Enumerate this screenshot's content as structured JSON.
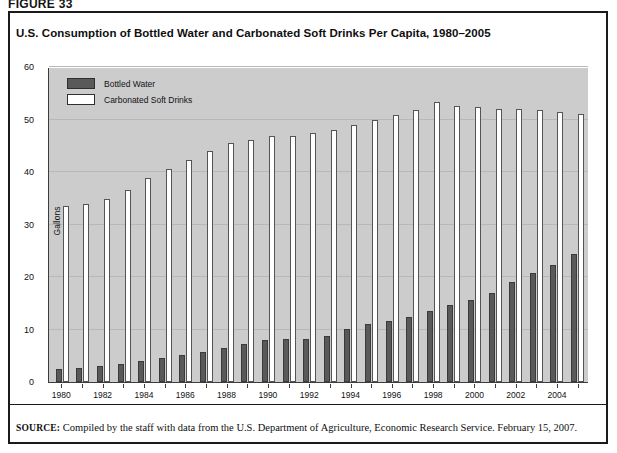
{
  "figure_label": "FIGURE 33",
  "title": "U.S. Consumption of Bottled Water and Carbonated Soft Drinks Per Capita, 1980–2005",
  "source": {
    "prefix": "SOURCE:",
    "text": " Compiled by the staff with data from the U.S. Department of Agriculture, Economic Research Service. February 15, 2007."
  },
  "legend": {
    "items": [
      {
        "label": "Bottled Water",
        "color": "#595959"
      },
      {
        "label": "Carbonated Soft Drinks",
        "color": "#ffffff"
      }
    ]
  },
  "colors": {
    "plot_background": "#cccccc",
    "bottled_water": "#595959",
    "carbonated_soft_drinks": "#ffffff",
    "axis": "#3d3d3d",
    "frame": "#1a1a1a"
  },
  "chart_data": {
    "type": "bar",
    "title": "U.S. Consumption of Bottled Water and Carbonated Soft Drinks Per Capita, 1980–2005",
    "xlabel": "",
    "ylabel": "Gallons",
    "ylim": [
      0,
      60
    ],
    "yticks": [
      0,
      10,
      20,
      30,
      40,
      50,
      60
    ],
    "grid": true,
    "legend_position": "top-left",
    "categories": [
      "1980",
      "1981",
      "1982",
      "1983",
      "1984",
      "1985",
      "1986",
      "1987",
      "1988",
      "1989",
      "1990",
      "1991",
      "1992",
      "1993",
      "1994",
      "1995",
      "1996",
      "1997",
      "1998",
      "1999",
      "2000",
      "2001",
      "2002",
      "2003",
      "2004",
      "2005"
    ],
    "xtick_labels": [
      "1980",
      "",
      "1982",
      "",
      "1984",
      "",
      "1986",
      "",
      "1988",
      "",
      "1990",
      "",
      "1992",
      "",
      "1994",
      "",
      "1996",
      "",
      "1998",
      "",
      "2000",
      "",
      "2002",
      "",
      "2004",
      ""
    ],
    "series": [
      {
        "name": "Bottled Water",
        "values": [
          2.4,
          2.7,
          3.0,
          3.4,
          4.0,
          4.5,
          5.2,
          5.8,
          6.5,
          7.3,
          8.0,
          8.2,
          8.2,
          8.8,
          10.1,
          11.0,
          11.6,
          12.4,
          13.5,
          14.6,
          15.7,
          17.0,
          19.1,
          20.7,
          22.3,
          24.3
        ]
      },
      {
        "name": "Carbonated Soft Drinks",
        "values": [
          33.5,
          34.0,
          34.8,
          36.6,
          38.8,
          40.5,
          42.3,
          44.0,
          45.6,
          46.1,
          46.8,
          46.8,
          47.4,
          48.0,
          49.0,
          50.0,
          50.8,
          51.8,
          53.3,
          52.5,
          52.3,
          52.0,
          52.0,
          51.8,
          51.5,
          51.0
        ]
      }
    ]
  }
}
